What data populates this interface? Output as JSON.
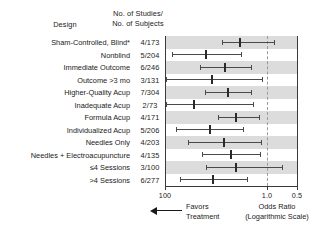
{
  "header": {
    "design_label": "Design",
    "counts_label_line1": "No. of Studies/",
    "counts_label_line2": "No. of Subjects"
  },
  "footer": {
    "favors_line1": "Favors",
    "favors_line2": "Treatment",
    "arrow_icon": "left-arrow-icon",
    "odds_ratio_line1": "Odds Ratio",
    "odds_ratio_line2": "(Logarithmic Scale)"
  },
  "colors": {
    "band": "#dcdcdc",
    "ci_line": "#4a4a4a",
    "marker": "#2a2a2a",
    "frame": "#3a3a3a",
    "reference_line": "#9a9a9a",
    "text": "#1a1a1a",
    "background": "#ffffff"
  },
  "chart_data": {
    "type": "scatter",
    "subtype": "forest-plot",
    "title": "",
    "xlabel": "Odds Ratio (Logarithmic Scale)",
    "ylabel": "Design",
    "scale": "log",
    "grid": false,
    "legend": "none",
    "reference_value": 1.0,
    "axis_ticks": [
      {
        "label": "100",
        "value": 100,
        "position_pct": 0
      },
      {
        "label": "1.0",
        "value": 1.0,
        "position_pct": 76.7
      },
      {
        "label": "0.5",
        "value": 0.5,
        "position_pct": 100
      }
    ],
    "axis_direction": "decreasing-left-to-right",
    "categories": [
      "Sham-Controlled, Blind*",
      "Nonblind",
      "Immediate Outcome",
      "Outcome >3 mo",
      "Higher-Quality Acup",
      "Inadequate Acup",
      "Formula Acup",
      "Individualized Acup",
      "Needles Only",
      "Needles + Electroacupuncture",
      "≤4 Sessions",
      ">4 Sessions"
    ],
    "counts": [
      "4/173",
      "5/204",
      "6/246",
      "3/131",
      "7/304",
      "2/73",
      "4/171",
      "5/206",
      "4/203",
      "4/135",
      "3/100",
      "6/277"
    ],
    "rows": [
      {
        "label": "Sham-Controlled, Blind*",
        "count": "4/173",
        "odds_ratio": 0.82,
        "ci_low": 1.1,
        "ci_high": 0.72,
        "x_pct": 56.5,
        "lo_pct": 42.5,
        "hi_pct": 82.0
      },
      {
        "label": "Nonblind",
        "count": "5/204",
        "odds_ratio": 2.3,
        "ci_low": 7.3,
        "ci_high": 1.15,
        "x_pct": 30.5,
        "lo_pct": 5.0,
        "hi_pct": 57.0
      },
      {
        "label": "Immediate Outcome",
        "count": "6/246",
        "odds_ratio": 1.55,
        "ci_low": 3.3,
        "ci_high": 1.0,
        "x_pct": 45.0,
        "lo_pct": 26.0,
        "hi_pct": 65.0
      },
      {
        "label": "Outcome >3 mo",
        "count": "3/131",
        "odds_ratio": 2.05,
        "ci_low": 26.0,
        "ci_high": 0.86,
        "x_pct": 35.0,
        "lo_pct": 0.5,
        "hi_pct": 73.0
      },
      {
        "label": "Higher-Quality Acup",
        "count": "7/304",
        "odds_ratio": 1.45,
        "ci_low": 3.1,
        "ci_high": 1.0,
        "x_pct": 47.5,
        "lo_pct": 30.0,
        "hi_pct": 65.0
      },
      {
        "label": "Inadequate Acup",
        "count": "2/73",
        "odds_ratio": 3.1,
        "ci_low": 30.0,
        "ci_high": 1.0,
        "x_pct": 22.0,
        "lo_pct": 0.5,
        "hi_pct": 66.0
      },
      {
        "label": "Formula Acup",
        "count": "4/171",
        "odds_ratio": 1.1,
        "ci_low": 2.05,
        "ci_high": 0.85,
        "x_pct": 53.5,
        "lo_pct": 40.0,
        "hi_pct": 71.0
      },
      {
        "label": "Individualized Acup",
        "count": "5/206",
        "odds_ratio": 2.05,
        "ci_low": 7.6,
        "ci_high": 1.12,
        "x_pct": 34.0,
        "lo_pct": 8.0,
        "hi_pct": 59.0
      },
      {
        "label": "Needles Only",
        "count": "4/203",
        "odds_ratio": 1.55,
        "ci_low": 5.0,
        "ci_high": 0.88,
        "x_pct": 44.0,
        "lo_pct": 17.5,
        "hi_pct": 72.0
      },
      {
        "label": "Needles + Electroacupuncture",
        "count": "4/135",
        "odds_ratio": 1.3,
        "ci_low": 2.6,
        "ci_high": 0.9,
        "x_pct": 49.5,
        "lo_pct": 27.5,
        "hi_pct": 71.5
      },
      {
        "label": "≤4 Sessions",
        "count": "3/100",
        "odds_ratio": 1.1,
        "ci_low": 2.7,
        "ci_high": 0.66,
        "x_pct": 53.5,
        "lo_pct": 30.5,
        "hi_pct": 88.0
      },
      {
        "label": ">4 Sessions",
        "count": "6/277",
        "odds_ratio": 2.0,
        "ci_low": 8.5,
        "ci_high": 1.05,
        "x_pct": 36.0,
        "lo_pct": 11.5,
        "hi_pct": 62.0
      }
    ]
  }
}
